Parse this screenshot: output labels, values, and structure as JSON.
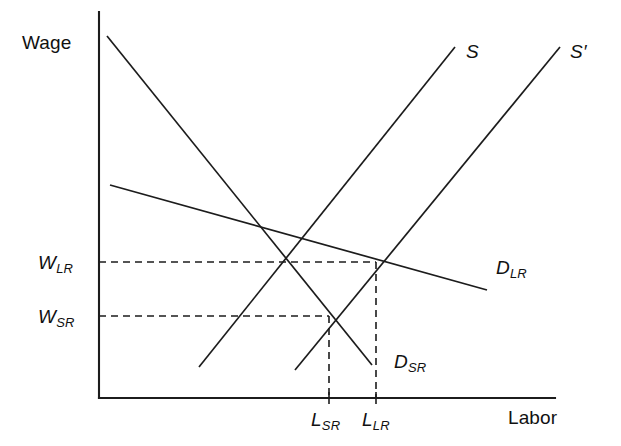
{
  "figure": {
    "kind": "supply-demand-diagram",
    "background_color": "#ffffff",
    "line_color": "#1c1c1c",
    "axes": {
      "y_axis_label": "Wage",
      "x_axis_label": "Labor"
    },
    "value_labels": {
      "wage_long_run": {
        "base": "W",
        "sub": "LR"
      },
      "wage_short_run": {
        "base": "W",
        "sub": "SR"
      },
      "labor_short_run": {
        "base": "L",
        "sub": "SR"
      },
      "labor_long_run": {
        "base": "L",
        "sub": "LR"
      }
    },
    "curve_labels": {
      "supply": {
        "base": "S",
        "sub": ""
      },
      "supply_shifted": {
        "base": "S",
        "prime": "′"
      },
      "demand_long_run": {
        "base": "D",
        "sub": "LR"
      },
      "demand_short_run": {
        "base": "D",
        "sub": "SR"
      }
    }
  },
  "chart_data": {
    "type": "line",
    "title": "",
    "xlabel": "Labor",
    "ylabel": "Wage",
    "grid": false,
    "legend_position": "inline-curve-labels",
    "axis_note": "Unitless schematic axes; no numeric tick values shown.",
    "axes_pixels": {
      "y_axis_x": 99,
      "y_axis_top_y": 12,
      "x_axis_y": 398,
      "x_axis_right_x": 555,
      "origin": [
        99,
        398
      ]
    },
    "series": [
      {
        "name": "D_SR",
        "label": "D",
        "sublabel": "SR",
        "role": "short-run labor demand",
        "style": "solid",
        "slope": "steep-negative",
        "points_px": [
          [
            107,
            36
          ],
          [
            372,
            365
          ]
        ],
        "label_pos_px": [
          394,
          352
        ]
      },
      {
        "name": "D_LR",
        "label": "D",
        "sublabel": "LR",
        "role": "long-run labor demand",
        "style": "solid",
        "slope": "shallow-negative",
        "points_px": [
          [
            110,
            185
          ],
          [
            487,
            290
          ]
        ],
        "label_pos_px": [
          496,
          258
        ]
      },
      {
        "name": "S",
        "label": "S",
        "sublabel": "",
        "role": "labor supply",
        "style": "solid",
        "slope": "positive",
        "points_px": [
          [
            199,
            367
          ],
          [
            455,
            47
          ]
        ],
        "label_pos_px": [
          466,
          42
        ]
      },
      {
        "name": "S_prime",
        "label": "S′",
        "sublabel": "",
        "role": "shifted labor supply",
        "style": "solid",
        "slope": "positive",
        "points_px": [
          [
            295,
            370
          ],
          [
            560,
            47
          ]
        ],
        "label_pos_px": [
          570,
          42
        ]
      }
    ],
    "equilibria": [
      {
        "name": "short-run equilibrium",
        "intersection_of": [
          "D_SR",
          "S"
        ],
        "point_px": [
          329,
          316
        ],
        "wage_label": "W_SR",
        "labor_label": "L_SR"
      },
      {
        "name": "long-run equilibrium",
        "intersection_of": [
          "D_LR",
          "S_prime"
        ],
        "point_px": [
          376,
          262
        ],
        "wage_label": "W_LR",
        "labor_label": "L_LR"
      }
    ],
    "guide_lines": [
      {
        "name": "W_LR-horizontal",
        "orientation": "horizontal",
        "from_px": [
          99,
          262
        ],
        "to_px": [
          376,
          262
        ],
        "style": "dashed"
      },
      {
        "name": "W_SR-horizontal",
        "orientation": "horizontal",
        "from_px": [
          99,
          316
        ],
        "to_px": [
          329,
          316
        ],
        "style": "dashed"
      },
      {
        "name": "L_SR-vertical",
        "orientation": "vertical",
        "from_px": [
          329,
          316
        ],
        "to_px": [
          329,
          398
        ],
        "style": "dashed"
      },
      {
        "name": "L_LR-vertical",
        "orientation": "vertical",
        "from_px": [
          376,
          262
        ],
        "to_px": [
          376,
          398
        ],
        "style": "dashed"
      }
    ],
    "ticks": {
      "x": [
        {
          "label": "L_SR",
          "x_px": 329
        },
        {
          "label": "L_LR",
          "x_px": 376
        }
      ],
      "y": []
    }
  }
}
